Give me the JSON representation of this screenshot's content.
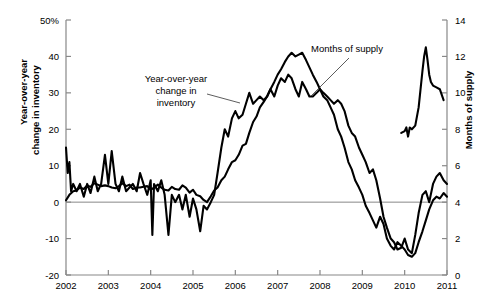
{
  "chart_data": {
    "type": "line",
    "title": "",
    "subtitle": "",
    "xlabel": "",
    "ylabel": "Year-over-year change in inventory",
    "y2label": "Months of supply",
    "grid": false,
    "legend_position": "inline-annotations",
    "xlim": [
      2002.0,
      2011.0
    ],
    "ylim": [
      -20,
      50
    ],
    "y2lim": [
      0,
      14
    ],
    "x_ticks": [
      "2002",
      "2003",
      "2004",
      "2005",
      "2006",
      "2007",
      "2008",
      "2009",
      "2010",
      "2011"
    ],
    "y_ticks": [
      "-20",
      "-10",
      "0",
      "10",
      "20",
      "30",
      "40",
      "50%"
    ],
    "y2_ticks": [
      "0",
      "2",
      "4",
      "6",
      "8",
      "10",
      "12",
      "14"
    ],
    "zero_line_value": 0,
    "annotations": [
      {
        "name": "inventory-annotation",
        "text_lines": [
          "Year-over-year",
          "change in",
          "inventory"
        ],
        "text_x": 176,
        "text_y": 82,
        "leader": [
          [
            207,
            94
          ],
          [
            240,
            103
          ]
        ]
      },
      {
        "name": "months-annotation",
        "text_lines": [
          "Months of supply"
        ],
        "text_x": 347,
        "text_y": 52,
        "leader": [
          [
            349,
            58
          ],
          [
            311,
            96
          ]
        ]
      }
    ],
    "series": [
      {
        "name": "Year-over-year change in inventory",
        "axis": "left",
        "unit": "percent",
        "color": "#000000",
        "points": [
          [
            2002.0,
            0.5
          ],
          [
            2002.08,
            2.0
          ],
          [
            2002.17,
            3.0
          ],
          [
            2002.25,
            3.2
          ],
          [
            2002.33,
            4.0
          ],
          [
            2002.42,
            3.6
          ],
          [
            2002.5,
            4.6
          ],
          [
            2002.58,
            4.2
          ],
          [
            2002.67,
            5.2
          ],
          [
            2002.75,
            4.8
          ],
          [
            2002.83,
            4.4
          ],
          [
            2002.92,
            4.6
          ],
          [
            2003.0,
            4.4
          ],
          [
            2003.08,
            4.0
          ],
          [
            2003.17,
            3.8
          ],
          [
            2003.25,
            4.4
          ],
          [
            2003.33,
            5.2
          ],
          [
            2003.42,
            4.4
          ],
          [
            2003.5,
            4.8
          ],
          [
            2003.58,
            3.6
          ],
          [
            2003.67,
            4.0
          ],
          [
            2003.75,
            4.0
          ],
          [
            2003.83,
            4.2
          ],
          [
            2003.92,
            4.4
          ],
          [
            2004.0,
            3.4
          ],
          [
            2004.08,
            4.0
          ],
          [
            2004.17,
            4.8
          ],
          [
            2004.25,
            4.0
          ],
          [
            2004.33,
            3.4
          ],
          [
            2004.42,
            3.2
          ],
          [
            2004.5,
            4.2
          ],
          [
            2004.58,
            3.6
          ],
          [
            2004.67,
            3.4
          ],
          [
            2004.75,
            4.6
          ],
          [
            2004.83,
            4.0
          ],
          [
            2004.92,
            2.6
          ],
          [
            2005.0,
            3.4
          ],
          [
            2005.08,
            2.0
          ],
          [
            2005.17,
            1.6
          ],
          [
            2005.25,
            0.6
          ],
          [
            2005.33,
            0.0
          ],
          [
            2005.42,
            1.6
          ],
          [
            2005.5,
            3.2
          ],
          [
            2005.58,
            4.0
          ],
          [
            2005.67,
            6.0
          ],
          [
            2005.75,
            7.0
          ],
          [
            2005.83,
            9.0
          ],
          [
            2005.92,
            11.0
          ],
          [
            2006.0,
            11.5
          ],
          [
            2006.08,
            13.0
          ],
          [
            2006.17,
            15.5
          ],
          [
            2006.25,
            16.0
          ],
          [
            2006.33,
            19.0
          ],
          [
            2006.42,
            22.0
          ],
          [
            2006.5,
            23.5
          ],
          [
            2006.58,
            26.0
          ],
          [
            2006.67,
            27.5
          ],
          [
            2006.75,
            29.0
          ],
          [
            2006.83,
            31.0
          ],
          [
            2006.92,
            33.0
          ],
          [
            2007.0,
            35.0
          ],
          [
            2007.08,
            36.5
          ],
          [
            2007.17,
            38.5
          ],
          [
            2007.25,
            40.0
          ],
          [
            2007.33,
            41.0
          ],
          [
            2007.42,
            40.0
          ],
          [
            2007.5,
            40.5
          ],
          [
            2007.58,
            41.0
          ],
          [
            2007.67,
            39.0
          ],
          [
            2007.75,
            37.0
          ],
          [
            2007.83,
            35.0
          ],
          [
            2007.92,
            33.0
          ],
          [
            2008.0,
            31.0
          ],
          [
            2008.08,
            29.0
          ],
          [
            2008.17,
            28.0
          ],
          [
            2008.25,
            26.0
          ],
          [
            2008.33,
            24.0
          ],
          [
            2008.42,
            20.0
          ],
          [
            2008.5,
            18.0
          ],
          [
            2008.58,
            15.0
          ],
          [
            2008.67,
            11.0
          ],
          [
            2008.75,
            9.0
          ],
          [
            2008.83,
            6.0
          ],
          [
            2008.92,
            4.0
          ],
          [
            2009.0,
            2.0
          ],
          [
            2009.08,
            -1.0
          ],
          [
            2009.17,
            -3.0
          ],
          [
            2009.25,
            -5.0
          ],
          [
            2009.33,
            -7.0
          ],
          [
            2009.42,
            -4.0
          ],
          [
            2009.5,
            -6.0
          ],
          [
            2009.58,
            -10.0
          ],
          [
            2009.67,
            -12.0
          ],
          [
            2009.75,
            -13.0
          ],
          [
            2009.83,
            -11.0
          ],
          [
            2009.92,
            -12.0
          ],
          [
            2010.0,
            -13.0
          ],
          [
            2010.08,
            -14.5
          ],
          [
            2010.17,
            -15.0
          ],
          [
            2010.25,
            -14.0
          ],
          [
            2010.33,
            -11.0
          ],
          [
            2010.42,
            -8.0
          ],
          [
            2010.5,
            -5.0
          ],
          [
            2010.58,
            -2.0
          ],
          [
            2010.67,
            0.5
          ],
          [
            2010.75,
            1.5
          ],
          [
            2010.83,
            1.0
          ],
          [
            2010.92,
            2.5
          ],
          [
            2011.0,
            1.5
          ]
        ]
      },
      {
        "name": "Months of supply",
        "axis": "right",
        "unit": "months",
        "color": "#000000",
        "points": [
          [
            2002.0,
            7.0
          ],
          [
            2002.04,
            5.6
          ],
          [
            2002.08,
            6.2
          ],
          [
            2002.12,
            4.6
          ],
          [
            2002.17,
            5.0
          ],
          [
            2002.25,
            4.6
          ],
          [
            2002.33,
            5.0
          ],
          [
            2002.42,
            4.3
          ],
          [
            2002.5,
            5.0
          ],
          [
            2002.58,
            4.5
          ],
          [
            2002.67,
            5.4
          ],
          [
            2002.75,
            4.6
          ],
          [
            2002.83,
            5.0
          ],
          [
            2002.92,
            6.6
          ],
          [
            2003.0,
            5.0
          ],
          [
            2003.08,
            6.8
          ],
          [
            2003.17,
            5.0
          ],
          [
            2003.25,
            4.6
          ],
          [
            2003.33,
            5.4
          ],
          [
            2003.42,
            4.6
          ],
          [
            2003.5,
            4.8
          ],
          [
            2003.58,
            5.0
          ],
          [
            2003.67,
            4.6
          ],
          [
            2003.75,
            5.6
          ],
          [
            2003.83,
            5.0
          ],
          [
            2003.92,
            4.4
          ],
          [
            2004.0,
            5.2
          ],
          [
            2004.04,
            2.2
          ],
          [
            2004.08,
            5.0
          ],
          [
            2004.17,
            4.6
          ],
          [
            2004.25,
            5.2
          ],
          [
            2004.33,
            4.4
          ],
          [
            2004.42,
            2.2
          ],
          [
            2004.5,
            4.4
          ],
          [
            2004.58,
            4.0
          ],
          [
            2004.67,
            4.4
          ],
          [
            2004.75,
            3.6
          ],
          [
            2004.83,
            4.4
          ],
          [
            2004.92,
            3.2
          ],
          [
            2005.0,
            4.2
          ],
          [
            2005.08,
            3.6
          ],
          [
            2005.17,
            2.4
          ],
          [
            2005.25,
            3.8
          ],
          [
            2005.33,
            3.6
          ],
          [
            2005.42,
            4.0
          ],
          [
            2005.5,
            4.4
          ],
          [
            2005.58,
            5.6
          ],
          [
            2005.67,
            7.0
          ],
          [
            2005.75,
            8.0
          ],
          [
            2005.83,
            7.6
          ],
          [
            2005.92,
            8.6
          ],
          [
            2006.0,
            9.0
          ],
          [
            2006.08,
            8.6
          ],
          [
            2006.17,
            8.8
          ],
          [
            2006.25,
            9.4
          ],
          [
            2006.33,
            10.0
          ],
          [
            2006.42,
            9.4
          ],
          [
            2006.5,
            9.6
          ],
          [
            2006.58,
            9.8
          ],
          [
            2006.67,
            9.6
          ],
          [
            2006.75,
            9.8
          ],
          [
            2006.83,
            10.2
          ],
          [
            2006.92,
            9.8
          ],
          [
            2007.0,
            10.4
          ],
          [
            2007.08,
            10.8
          ],
          [
            2007.17,
            10.6
          ],
          [
            2007.25,
            11.0
          ],
          [
            2007.33,
            10.8
          ],
          [
            2007.42,
            10.2
          ],
          [
            2007.5,
            9.8
          ],
          [
            2007.58,
            10.6
          ],
          [
            2007.67,
            10.2
          ],
          [
            2007.75,
            9.8
          ],
          [
            2007.83,
            9.8
          ],
          [
            2007.92,
            10.0
          ],
          [
            2008.0,
            10.2
          ],
          [
            2008.08,
            10.0
          ],
          [
            2008.17,
            9.8
          ],
          [
            2008.25,
            9.6
          ],
          [
            2008.33,
            9.4
          ],
          [
            2008.42,
            9.6
          ],
          [
            2008.5,
            9.4
          ],
          [
            2008.58,
            9.0
          ],
          [
            2008.67,
            8.2
          ],
          [
            2008.75,
            7.8
          ],
          [
            2008.83,
            7.6
          ],
          [
            2008.92,
            7.0
          ],
          [
            2009.0,
            6.6
          ],
          [
            2009.08,
            6.2
          ],
          [
            2009.17,
            5.6
          ],
          [
            2009.25,
            5.8
          ],
          [
            2009.33,
            5.2
          ],
          [
            2009.42,
            4.2
          ],
          [
            2009.5,
            3.2
          ],
          [
            2009.58,
            2.6
          ],
          [
            2009.67,
            2.0
          ],
          [
            2009.75,
            1.8
          ],
          [
            2009.83,
            1.4
          ],
          [
            2009.92,
            1.5
          ],
          [
            2010.0,
            2.0
          ],
          [
            2010.08,
            1.4
          ],
          [
            2010.17,
            1.2
          ],
          [
            2010.25,
            2.2
          ],
          [
            2010.33,
            3.4
          ],
          [
            2010.42,
            4.4
          ],
          [
            2010.5,
            4.6
          ],
          [
            2010.58,
            4.0
          ],
          [
            2010.67,
            5.0
          ],
          [
            2010.75,
            5.4
          ],
          [
            2010.83,
            5.6
          ],
          [
            2010.92,
            5.2
          ],
          [
            2011.0,
            5.0
          ]
        ]
      },
      {
        "name": "Months of supply (late spike)",
        "axis": "right",
        "unit": "months",
        "color": "#000000",
        "points": [
          [
            2009.92,
            7.8
          ],
          [
            2010.0,
            7.9
          ],
          [
            2010.04,
            8.1
          ],
          [
            2010.08,
            7.6
          ],
          [
            2010.12,
            8.1
          ],
          [
            2010.17,
            8.0
          ],
          [
            2010.25,
            8.2
          ],
          [
            2010.33,
            9.2
          ],
          [
            2010.42,
            11.2
          ],
          [
            2010.46,
            12.0
          ],
          [
            2010.5,
            12.5
          ],
          [
            2010.54,
            11.8
          ],
          [
            2010.58,
            11.0
          ],
          [
            2010.62,
            10.6
          ],
          [
            2010.67,
            10.4
          ],
          [
            2010.75,
            10.3
          ],
          [
            2010.83,
            10.2
          ],
          [
            2010.92,
            9.6
          ]
        ]
      }
    ]
  },
  "axes": {
    "left_title": "Year-over-year\nchange in inventory",
    "left_title_line1": "Year-over-year",
    "left_title_line2": "change in inventory",
    "right_title": "Months of supply",
    "left_ticks": [
      "50%",
      "40",
      "30",
      "20",
      "10",
      "0",
      "-10",
      "-20"
    ],
    "right_ticks": [
      "14",
      "12",
      "10",
      "8",
      "6",
      "4",
      "2",
      "0"
    ],
    "x_ticks": [
      "2002",
      "2003",
      "2004",
      "2005",
      "2006",
      "2007",
      "2008",
      "2009",
      "2010",
      "2011"
    ]
  },
  "annotations": {
    "inventory_line1": "Year-over-year",
    "inventory_line2": "change in",
    "inventory_line3": "inventory",
    "months_of_supply": "Months of supply"
  },
  "colors": {
    "series": "#000000",
    "axis": "#888888",
    "zero_line": "#888888",
    "background": "#ffffff"
  }
}
